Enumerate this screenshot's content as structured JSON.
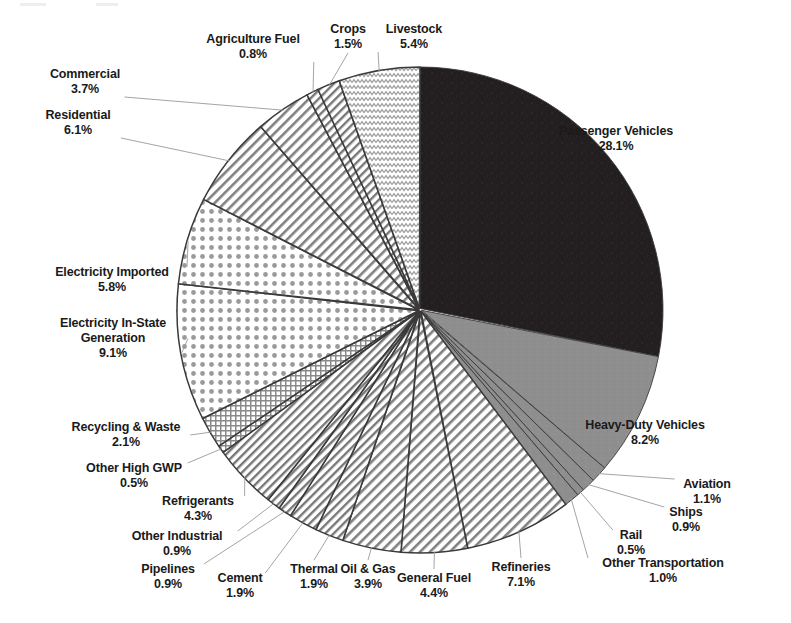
{
  "chart_data": {
    "type": "pie",
    "title": "",
    "subtitle": "",
    "xlabel": "",
    "ylabel": "",
    "legend_position": "none",
    "grid": false,
    "units": "percent",
    "start_angle_deg": 0,
    "direction": "clockwise",
    "center": {
      "x": 420,
      "y": 310
    },
    "radius": 243,
    "categories": [
      "Passenger Vehicles",
      "Heavy-Duty Vehicles",
      "Aviation",
      "Ships",
      "Rail",
      "Other Transportation",
      "Refineries",
      "General Fuel",
      "Oil & Gas",
      "Thermal",
      "Cement",
      "Pipelines",
      "Other Industrial",
      "Refrigerants",
      "Other High GWP",
      "Recycling & Waste",
      "Electricity In-State Generation",
      "Electricity Imported",
      "Residential",
      "Commercial",
      "Agriculture Fuel",
      "Crops",
      "Livestock"
    ],
    "values": [
      28.1,
      8.2,
      1.1,
      0.9,
      0.5,
      1.0,
      7.1,
      4.4,
      3.9,
      1.9,
      1.9,
      0.9,
      0.9,
      4.3,
      0.5,
      2.1,
      9.1,
      5.8,
      6.1,
      3.7,
      0.8,
      1.5,
      5.4
    ],
    "value_labels": [
      "28.1%",
      "8.2%",
      "1.1%",
      "0.9%",
      "0.5%",
      "1.0%",
      "7.1%",
      "4.4%",
      "3.9%",
      "1.9%",
      "1.9%",
      "0.9%",
      "0.9%",
      "4.3%",
      "0.5%",
      "2.1%",
      "9.1%",
      "5.8%",
      "6.1%",
      "3.7%",
      "0.8%",
      "1.5%",
      "5.4%"
    ],
    "slice_fills": [
      "solid-black",
      "solid-gray",
      "solid-gray",
      "solid-gray",
      "solid-gray",
      "solid-gray",
      "diagonal-hatch",
      "diagonal-hatch",
      "diagonal-hatch",
      "diagonal-hatch",
      "diagonal-hatch",
      "diagonal-hatch",
      "diagonal-hatch",
      "diagonal-hatch",
      "cross-hatch",
      "cross-hatch",
      "dot-grid",
      "dot-grid",
      "diagonal-hatch",
      "diagonal-hatch",
      "diagonal-hatch",
      "diagonal-hatch",
      "wavy-zigzag"
    ]
  },
  "colors": {
    "background": "#ffffff",
    "outline": "#3a3a3a",
    "text": "#1a1a1a",
    "leader_line": "#8c8c8c",
    "solid_black": "#231f20",
    "solid_gray": "#8e8e8e",
    "pattern_ink": "#6e6e6e"
  },
  "labels": [
    {
      "id": "passenger-vehicles",
      "name": "Passenger Vehicles",
      "value": "28.1%",
      "x": 616,
      "y": 124,
      "leader": false
    },
    {
      "id": "heavy-duty-vehicles",
      "name": "Heavy-Duty Vehicles",
      "value": "8.2%",
      "x": 645,
      "y": 418,
      "leader": false
    },
    {
      "id": "aviation",
      "name": "Aviation",
      "value": "1.1%",
      "x": 707,
      "y": 477,
      "leader": true
    },
    {
      "id": "ships",
      "name": "Ships",
      "value": "0.9%",
      "x": 686,
      "y": 505,
      "leader": true
    },
    {
      "id": "rail",
      "name": "Rail",
      "value": "0.5%",
      "x": 631,
      "y": 528,
      "leader": true
    },
    {
      "id": "other-transportation",
      "name": "Other Transportation",
      "value": "1.0%",
      "x": 663,
      "y": 556,
      "leader": true
    },
    {
      "id": "refineries",
      "name": "Refineries",
      "value": "7.1%",
      "x": 521,
      "y": 560,
      "leader": true
    },
    {
      "id": "general-fuel",
      "name": "General Fuel",
      "value": "4.4%",
      "x": 434,
      "y": 571,
      "leader": true
    },
    {
      "id": "oil-and-gas",
      "name": "Oil & Gas",
      "value": "3.9%",
      "x": 368,
      "y": 562,
      "leader": true
    },
    {
      "id": "thermal",
      "name": "Thermal",
      "value": "1.9%",
      "x": 314,
      "y": 562,
      "leader": true
    },
    {
      "id": "cement",
      "name": "Cement",
      "value": "1.9%",
      "x": 240,
      "y": 571,
      "leader": true
    },
    {
      "id": "pipelines",
      "name": "Pipelines",
      "value": "0.9%",
      "x": 168,
      "y": 562,
      "leader": true
    },
    {
      "id": "other-industrial",
      "name": "Other Industrial",
      "value": "0.9%",
      "x": 177,
      "y": 529,
      "leader": true
    },
    {
      "id": "refrigerants",
      "name": "Refrigerants",
      "value": "4.3%",
      "x": 198,
      "y": 494,
      "leader": true
    },
    {
      "id": "other-high-gwp",
      "name": "Other High GWP",
      "value": "0.5%",
      "x": 134,
      "y": 461,
      "leader": true
    },
    {
      "id": "recycling-and-waste",
      "name": "Recycling & Waste",
      "value": "2.1%",
      "x": 126,
      "y": 420,
      "leader": true
    },
    {
      "id": "electricity-in-state-generation",
      "name": "Electricity In-State",
      "name2": "Generation",
      "value": "9.1%",
      "x": 113,
      "y": 316,
      "leader": true
    },
    {
      "id": "electricity-imported",
      "name": "Electricity Imported",
      "value": "5.8%",
      "x": 112,
      "y": 265,
      "leader": true
    },
    {
      "id": "residential",
      "name": "Residential",
      "value": "6.1%",
      "x": 78,
      "y": 108,
      "leader": true
    },
    {
      "id": "commercial",
      "name": "Commercial",
      "value": "3.7%",
      "x": 85,
      "y": 67,
      "leader": true
    },
    {
      "id": "agriculture-fuel",
      "name": "Agriculture Fuel",
      "value": "0.8%",
      "x": 253,
      "y": 32,
      "leader": true
    },
    {
      "id": "crops",
      "name": "Crops",
      "value": "1.5%",
      "x": 348,
      "y": 22,
      "leader": true
    },
    {
      "id": "livestock",
      "name": "Livestock",
      "value": "5.4%",
      "x": 414,
      "y": 22,
      "leader": true
    }
  ]
}
